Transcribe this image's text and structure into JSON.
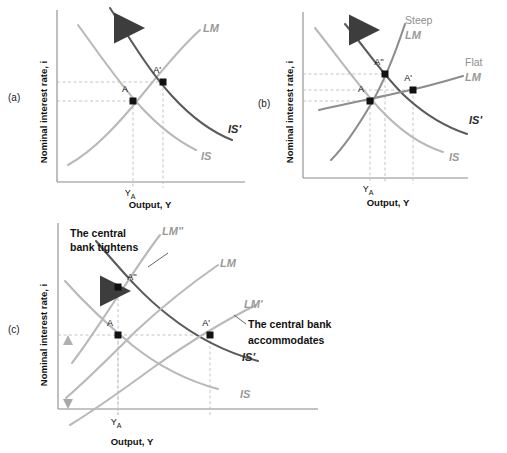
{
  "figure": {
    "axis_y_label": "Nominal interest rate, i",
    "axis_x_label": "Output, Y",
    "tick_x_label": "Y",
    "tick_x_sub": "A"
  },
  "colors": {
    "curve_dark": "#5a5a5a",
    "curve_light": "#b9b9b9",
    "curve_mid": "#8d8d8d",
    "axis": "#8a8a8a",
    "dash": "#bdbdbd",
    "point": "#111111",
    "text": "#1a1a1a",
    "label_light": "#9a9a9a"
  },
  "panels": [
    {
      "tag": "(a)",
      "name": "panel-a",
      "axis_y_label": "Nominal interest rate, i",
      "axis_x_label": "Output, Y",
      "tick_x_label": "Y",
      "tick_x_sub": "A",
      "curves": [
        {
          "name": "LM",
          "label": "LM",
          "shade": "light"
        },
        {
          "name": "IS",
          "label": "IS",
          "shade": "light"
        },
        {
          "name": "IS-prime",
          "label": "IS'",
          "shade": "dark"
        }
      ],
      "points": [
        {
          "label": "A"
        },
        {
          "label": "A'"
        }
      ],
      "arrows": [
        {
          "name": "is-shift-arrow",
          "direction": "right"
        }
      ]
    },
    {
      "tag": "(b)",
      "name": "panel-b",
      "axis_y_label": "Nominal interest rate, i",
      "axis_x_label": "Output, Y",
      "tick_x_label": "Y",
      "tick_x_sub": "A",
      "curves": [
        {
          "name": "steep-LM",
          "label_line1": "Steep",
          "label_line2": "LM",
          "shade": "mid"
        },
        {
          "name": "flat-LM",
          "label_line1": "Flat",
          "label_line2": "LM",
          "shade": "mid"
        },
        {
          "name": "IS",
          "label": "IS",
          "shade": "light"
        },
        {
          "name": "IS-prime",
          "label": "IS'",
          "shade": "dark"
        }
      ],
      "points": [
        {
          "label": "A"
        },
        {
          "label": "A''"
        },
        {
          "label": "A'"
        }
      ],
      "arrows": [
        {
          "name": "is-shift-arrow",
          "direction": "right"
        }
      ]
    },
    {
      "tag": "(c)",
      "name": "panel-c",
      "axis_y_label": "Nominal interest rate, i",
      "axis_x_label": "Output, Y",
      "tick_x_label": "Y",
      "tick_x_sub": "A",
      "curves": [
        {
          "name": "LM-double-prime",
          "label": "LM''",
          "shade": "light"
        },
        {
          "name": "LM",
          "label": "LM",
          "shade": "light"
        },
        {
          "name": "LM-prime",
          "label": "LM'",
          "shade": "light"
        },
        {
          "name": "IS",
          "label": "IS",
          "shade": "light"
        },
        {
          "name": "IS-prime",
          "label": "IS'",
          "shade": "dark"
        }
      ],
      "points": [
        {
          "label": "A"
        },
        {
          "label": "A''"
        },
        {
          "label": "A'"
        }
      ],
      "annotations": [
        {
          "name": "tightens-annotation",
          "line1": "The central",
          "line2": "bank tightens"
        },
        {
          "name": "accommodates-annotation",
          "line1": "The central bank",
          "line2": "accommodates"
        }
      ],
      "arrows": [
        {
          "name": "is-shift-arrow",
          "direction": "right"
        },
        {
          "name": "lm-up-arrow",
          "direction": "up"
        },
        {
          "name": "lm-down-arrow",
          "direction": "down"
        }
      ]
    }
  ]
}
